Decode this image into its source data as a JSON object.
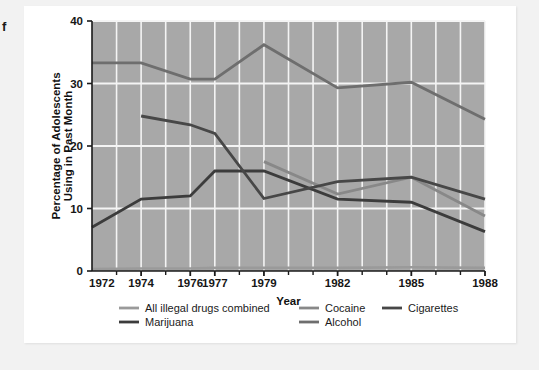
{
  "page": {
    "edge_letter": "f",
    "background": "#f2f2f2",
    "card_background": "#ffffff"
  },
  "chart_data": {
    "type": "line",
    "title": "",
    "xlabel": "Year",
    "ylabel": "Percentage of Adolescents Using in Past Month",
    "ylabel_line1": "Percentage of Adolescents",
    "ylabel_line2": "Using in Past Month",
    "x": [
      1972,
      1974,
      1976,
      1977,
      1979,
      1982,
      1985,
      1988
    ],
    "xlim": [
      1972,
      1988
    ],
    "ylim": [
      0,
      40
    ],
    "yticks": [
      0,
      10,
      20,
      30,
      40
    ],
    "ytick_labels": [
      "0",
      "10",
      "20",
      "30",
      "40"
    ],
    "xticks": [
      1972,
      1974,
      1976,
      1977,
      1979,
      1982,
      1985,
      1988
    ],
    "xtick_labels": [
      "1972",
      "1974",
      "1976",
      "1977",
      "1979",
      "1982",
      "1985",
      "1988"
    ],
    "minor_xticks": [
      1973,
      1975,
      1978,
      1980,
      1981,
      1983,
      1984,
      1986,
      1987
    ],
    "grid": "major-y-and-all-x, white lines on gray panel",
    "panel_color": "#a8a8a8",
    "grid_color": "#f4f4f4",
    "legend_position": "below-axes, 3 columns x 2 rows",
    "series": [
      {
        "name": "All illegal drugs combined",
        "color": "#9a9a9a",
        "x": [
          1972,
          1974,
          1976,
          1977,
          1979,
          1982,
          1985,
          1988
        ],
        "values": [
          0.3,
          0.4,
          0.4,
          0.5,
          0.5,
          0.5,
          0.6,
          0.5
        ]
      },
      {
        "name": "Marijuana",
        "color": "#3c3c3c",
        "x": [
          1972,
          1974,
          1976,
          1977,
          1979,
          1982,
          1985,
          1988
        ],
        "values": [
          7.0,
          11.5,
          12.0,
          16.0,
          16.0,
          11.5,
          11.0,
          6.3
        ]
      },
      {
        "name": "Cocaine",
        "color": "#888888",
        "x": [
          1972,
          1974,
          1976,
          1977,
          1979,
          1982,
          1985,
          1988
        ],
        "values": [
          null,
          null,
          null,
          null,
          17.5,
          12.3,
          15.0,
          8.8
        ]
      },
      {
        "name": "Alcohol",
        "color": "#6e6e6e",
        "x": [
          1972,
          1974,
          1976,
          1977,
          1979,
          1982,
          1985,
          1988
        ],
        "values": [
          33.3,
          33.3,
          30.7,
          30.7,
          36.2,
          29.3,
          30.2,
          24.3
        ]
      },
      {
        "name": "Cigarettes",
        "color": "#474747",
        "x": [
          1972,
          1974,
          1976,
          1977,
          1979,
          1982,
          1985,
          1988
        ],
        "values": [
          null,
          24.8,
          23.4,
          22.0,
          11.6,
          14.3,
          15.0,
          11.5
        ]
      }
    ],
    "series_notes": {
      "alcohol_vertices": [
        [
          1972,
          33.3
        ],
        [
          1974,
          33.3
        ],
        [
          1977,
          30.7
        ],
        [
          1979,
          36.2
        ],
        [
          1982,
          29.3
        ],
        [
          1985,
          30.2
        ],
        [
          1988,
          24.3
        ]
      ],
      "alcohol_start_x": 1974,
      "cigarettes_start_x": 1974,
      "cocaine_start_x": 1979
    }
  },
  "legend": {
    "entries": [
      {
        "label": "All illegal drugs combined",
        "color": "#9a9a9a",
        "col": 1,
        "row": 1
      },
      {
        "label": "Marijuana",
        "color": "#3c3c3c",
        "col": 1,
        "row": 2
      },
      {
        "label": "Cocaine",
        "color": "#888888",
        "col": 2,
        "row": 1
      },
      {
        "label": "Alcohol",
        "color": "#6e6e6e",
        "col": 2,
        "row": 2
      },
      {
        "label": "Cigarettes",
        "color": "#474747",
        "col": 3,
        "row": 1
      }
    ]
  }
}
